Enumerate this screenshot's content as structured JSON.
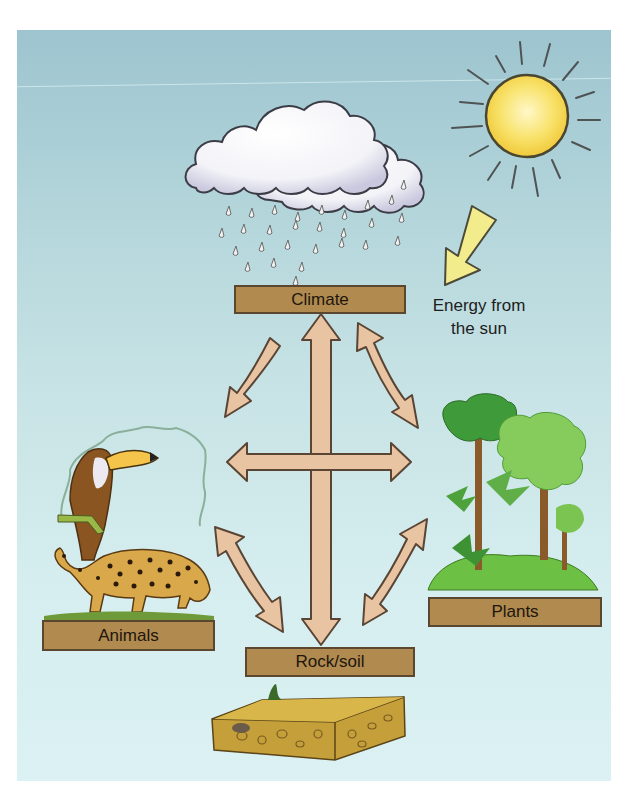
{
  "diagram": {
    "title": "",
    "nodes": [
      {
        "id": "climate",
        "label": "Climate"
      },
      {
        "id": "animals",
        "label": "Animals"
      },
      {
        "id": "plants",
        "label": "Plants"
      },
      {
        "id": "rock_soil",
        "label": "Rock/soil"
      }
    ],
    "edges": [
      {
        "from": "climate",
        "to": "animals",
        "direction": "one-way"
      },
      {
        "from": "climate",
        "to": "plants",
        "direction": "two-way"
      },
      {
        "from": "climate",
        "to": "rock_soil",
        "direction": "two-way"
      },
      {
        "from": "animals",
        "to": "plants",
        "direction": "two-way"
      },
      {
        "from": "animals",
        "to": "rock_soil",
        "direction": "two-way"
      },
      {
        "from": "plants",
        "to": "rock_soil",
        "direction": "two-way"
      }
    ],
    "energy_label_line1": "Energy from",
    "energy_label_line2": "the sun",
    "illustrations": [
      "rain-cloud",
      "sun",
      "sun-energy-arrow",
      "toucan",
      "jaguar",
      "rainforest-trees",
      "soil-block"
    ]
  },
  "colors": {
    "sky_top": "#9dc4cf",
    "sky_bottom": "#dbf1f3",
    "label_box": "#b08a4e",
    "label_border": "#5b4630",
    "arrow_fill": "#e9c4a3",
    "arrow_outline": "#5a4535",
    "sun": "#f5d94a",
    "energy_arrow": "#f3ec8c"
  }
}
